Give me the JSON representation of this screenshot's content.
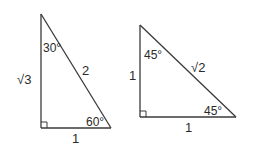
{
  "triangles": [
    {
      "name": "30-60-90 triangle",
      "angles": {
        "top": "30°",
        "bottom_right": "60°",
        "bottom_left": "right-angle"
      },
      "sides": {
        "vertical": "√3",
        "hypotenuse": "2",
        "base": "1"
      }
    },
    {
      "name": "45-45-90 triangle",
      "angles": {
        "top": "45°",
        "bottom_right": "45°",
        "bottom_left": "right-angle"
      },
      "sides": {
        "vertical": "1",
        "hypotenuse": "√2",
        "base": "1"
      }
    }
  ],
  "colors": {
    "line": "#3a3a3a",
    "text": "#2a2a2a",
    "background": "#ffffff"
  }
}
